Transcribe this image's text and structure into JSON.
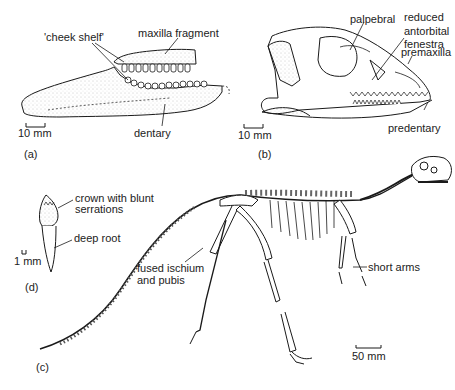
{
  "figure": {
    "panels": {
      "a": {
        "label": "(a)",
        "subject": "lower jaw (dentary) with maxilla fragment",
        "annotations": {
          "cheek_shelf": "'cheek shelf'",
          "maxilla_fragment": "maxilla fragment",
          "dentary": "dentary"
        },
        "scale_bar": "10 mm"
      },
      "b": {
        "label": "(b)",
        "subject": "skull, lateral view",
        "annotations": {
          "palpebral": "palpebral",
          "antorbital_1": "reduced",
          "antorbital_2": "antorbital",
          "antorbital_3": "fenestra",
          "premaxilla": "premaxilla",
          "predentary": "predentary"
        },
        "scale_bar": "10 mm"
      },
      "c": {
        "label": "(c)",
        "subject": "full skeleton, lateral view",
        "annotations": {
          "fused_1": "fused ischium",
          "fused_2": "and pubis",
          "short_arms": "short arms"
        },
        "scale_bar": "50 mm"
      },
      "d": {
        "label": "(d)",
        "subject": "isolated tooth",
        "annotations": {
          "crown_1": "crown with blunt",
          "crown_2": "serrations",
          "deep_root": "deep root"
        },
        "scale_bar": "1 mm"
      }
    },
    "colors": {
      "ink": "#1a1a1a",
      "stipple": "#9a9a9a",
      "background": "#ffffff"
    }
  }
}
